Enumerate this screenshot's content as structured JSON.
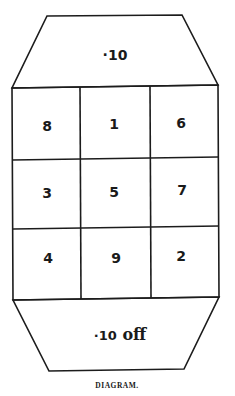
{
  "diagram": {
    "top_section": {
      "label": "·10"
    },
    "grid": {
      "rows": 3,
      "cols": 3,
      "cells": [
        [
          "8",
          "1",
          "6"
        ],
        [
          "3",
          "5",
          "7"
        ],
        [
          "4",
          "9",
          "2"
        ]
      ]
    },
    "bottom_section": {
      "number": "·10",
      "suffix": "off"
    },
    "caption": "DIAGRAM."
  }
}
